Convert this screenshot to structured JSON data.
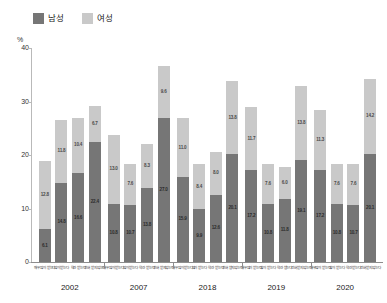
{
  "legend": {
    "items": [
      {
        "label": "남성",
        "color": "#767676",
        "icon": "square-swatch-icon"
      },
      {
        "label": "여성",
        "color": "#c9c9c9",
        "icon": "square-swatch-icon"
      }
    ]
  },
  "axis": {
    "unit_label": "%",
    "y_ticks": [
      "40",
      "30",
      "20",
      "10",
      "0"
    ],
    "y_min": 0,
    "y_max": 40
  },
  "chart_data": {
    "type": "bar",
    "title": "",
    "subtitle": "",
    "xlabel": "",
    "ylabel": "%",
    "ylim": [
      0,
      40
    ],
    "grid": false,
    "stacked": true,
    "legend_position": "top-left",
    "legend": [
      "남성",
      "여성"
    ],
    "group_labels": [
      "2002",
      "2007",
      "2018",
      "2019",
      "2020"
    ],
    "categories": [
      "매우많이 받는다",
      "많이 받는다",
      "약간 받는다",
      "전혀 받지않는다"
    ],
    "groups": [
      {
        "year": "2002",
        "bars": [
          {
            "category": "매우많이 받는다",
            "male": 6.1,
            "female": 12.8,
            "total": 18.9
          },
          {
            "category": "많이 받는다",
            "male": 14.8,
            "female": 11.8,
            "total": 26.6
          },
          {
            "category": "약간 받는다",
            "male": 16.6,
            "female": 10.4,
            "total": 27.0
          },
          {
            "category": "전혀 받지않는다",
            "male": 22.4,
            "female": 6.7,
            "total": 29.1
          }
        ]
      },
      {
        "year": "2007",
        "bars": [
          {
            "category": "매우많이 받는다",
            "male": 10.8,
            "female": 13.0,
            "total": 23.8
          },
          {
            "category": "많이 받는다",
            "male": 10.7,
            "female": 7.6,
            "total": 18.3
          },
          {
            "category": "약간 받는다",
            "male": 13.8,
            "female": 8.3,
            "total": 22.1
          },
          {
            "category": "전혀 받지않는다",
            "male": 27.0,
            "female": 9.6,
            "total": 36.6
          }
        ]
      },
      {
        "year": "2018",
        "bars": [
          {
            "category": "매우많이 받는다",
            "male": 15.9,
            "female": 11.0,
            "total": 26.9
          },
          {
            "category": "많이 받는다",
            "male": 9.9,
            "female": 8.4,
            "total": 18.3
          },
          {
            "category": "약간 받는다",
            "male": 12.6,
            "female": 8.0,
            "total": 20.6
          },
          {
            "category": "전혀 받지않는다",
            "male": 20.1,
            "female": 13.8,
            "total": 33.9
          }
        ]
      },
      {
        "year": "2019",
        "bars": [
          {
            "category": "매우많이 받는다",
            "male": 17.2,
            "female": 11.7,
            "total": 28.9
          },
          {
            "category": "많이 받는다",
            "male": 10.8,
            "female": 7.6,
            "total": 18.4
          },
          {
            "category": "약간 받는다",
            "male": 11.8,
            "female": 6.0,
            "total": 17.8
          },
          {
            "category": "전혀 받지않는다",
            "male": 19.1,
            "female": 13.8,
            "total": 32.9
          }
        ]
      },
      {
        "year": "2020",
        "bars": [
          {
            "category": "매우많이 받는다",
            "male": 17.2,
            "female": 11.3,
            "total": 28.5
          },
          {
            "category": "많이 받는다",
            "male": 10.8,
            "female": 7.6,
            "total": 18.4
          },
          {
            "category": "약간 받는다",
            "male": 10.7,
            "female": 7.6,
            "total": 18.3
          },
          {
            "category": "전혀 받지않는다",
            "male": 20.1,
            "female": 14.2,
            "total": 34.3
          }
        ]
      }
    ]
  }
}
